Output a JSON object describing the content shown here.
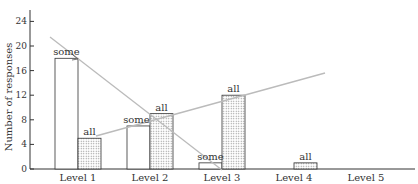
{
  "chart_data": {
    "type": "bar",
    "title": "",
    "xlabel": "",
    "ylabel": "Number of responses",
    "ylim": [
      0,
      26
    ],
    "yticks": [
      0,
      4,
      8,
      12,
      16,
      20,
      24
    ],
    "grid": false,
    "legend": "none (bars labeled directly with 'some' / 'all')",
    "categories": [
      "Level 1",
      "Level 2",
      "Level 3",
      "Level 4",
      "Level 5"
    ],
    "series": [
      {
        "name": "some",
        "fill": "white",
        "values": [
          18,
          7,
          1,
          0,
          0
        ]
      },
      {
        "name": "all",
        "fill": "dotted",
        "values": [
          5,
          9,
          12,
          1,
          0
        ]
      }
    ],
    "annotations": [
      {
        "type": "trend-line",
        "series": "some",
        "direction": "decreasing",
        "from": "left of Level 1 (~22)",
        "to": "Level 3 (~0)"
      },
      {
        "type": "trend-line",
        "series": "all",
        "direction": "increasing",
        "from": "Level 1 (~5)",
        "to": "between Level 3 and Level 4 (~15)"
      }
    ]
  },
  "colors": {
    "axis": "#333333",
    "bar_stroke": "#333333",
    "trend_line": "#bbbbbb",
    "dot_fill": "#999999"
  }
}
